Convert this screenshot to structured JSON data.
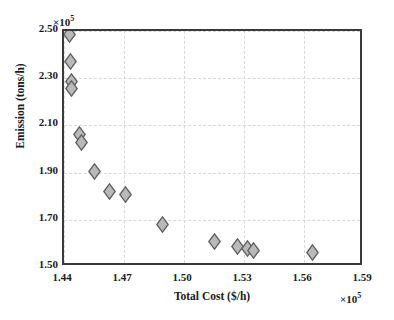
{
  "chart_data": {
    "type": "scatter",
    "title": "",
    "xlabel": "Total Cost ($/h)",
    "ylabel": "Emission (tons/h)",
    "x_multiplier": "×10",
    "x_multiplier_exp": "5",
    "y_multiplier": "×10",
    "y_multiplier_exp": "5",
    "xlim": [
      1.44,
      1.59
    ],
    "ylim": [
      1.5,
      2.5
    ],
    "xticks": [
      "1.44",
      "1.47",
      "1.50",
      "1.53",
      "1.56",
      "1.59"
    ],
    "yticks": [
      "2.50",
      "2.30",
      "2.10",
      "1.90",
      "1.70",
      "1.50"
    ],
    "xtick_values": [
      1.44,
      1.47,
      1.5,
      1.53,
      1.56,
      1.59
    ],
    "ytick_values": [
      2.5,
      2.3,
      2.1,
      1.9,
      1.7,
      1.5
    ],
    "grid": true,
    "legend": false,
    "marker": "diamond",
    "marker_fill": "#b9b9b9",
    "marker_edge": "#5f5f5f",
    "series": [
      {
        "name": "Pareto front",
        "points": [
          {
            "x": 1.4425,
            "y": 2.487
          },
          {
            "x": 1.4432,
            "y": 2.37
          },
          {
            "x": 1.4435,
            "y": 2.288
          },
          {
            "x": 1.4437,
            "y": 2.258
          },
          {
            "x": 1.4475,
            "y": 2.06
          },
          {
            "x": 1.4487,
            "y": 2.028
          },
          {
            "x": 1.4552,
            "y": 1.905
          },
          {
            "x": 1.4625,
            "y": 1.82
          },
          {
            "x": 1.4705,
            "y": 1.808
          },
          {
            "x": 1.489,
            "y": 1.682
          },
          {
            "x": 1.515,
            "y": 1.61
          },
          {
            "x": 1.5265,
            "y": 1.588
          },
          {
            "x": 1.5315,
            "y": 1.578
          },
          {
            "x": 1.5345,
            "y": 1.57
          },
          {
            "x": 1.564,
            "y": 1.562
          }
        ]
      }
    ]
  }
}
